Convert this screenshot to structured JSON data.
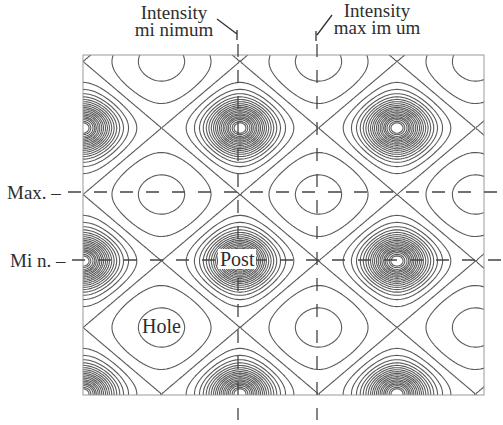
{
  "figure": {
    "annotations": {
      "intensity_minimum": {
        "line1": "Intensity",
        "line2": "mi nimum"
      },
      "intensity_maximum": {
        "line1": "Intensity",
        "line2": "max im um"
      },
      "max_row_label": "Max. –",
      "min_row_label": "Mi n. –",
      "post_label": "Post",
      "hole_label": "Hole"
    },
    "colors": {
      "line": "#5a5a5a",
      "frame": "#9a9a9a",
      "dash": "#444444",
      "text": "#2e2e2e"
    }
  },
  "chart_data": {
    "type": "contour",
    "title": "",
    "xlabel": "",
    "ylabel": "",
    "frame_px": {
      "left": 83,
      "top": 55,
      "right": 484,
      "bottom": 395
    },
    "lattice": {
      "maxima_px": [
        [
          83,
          128
        ],
        [
          238,
          128
        ],
        [
          396,
          128
        ],
        [
          83,
          261
        ],
        [
          240,
          261
        ],
        [
          396,
          261
        ],
        [
          83,
          396
        ],
        [
          238,
          396
        ],
        [
          396,
          396
        ]
      ],
      "minima_holes_px": [
        [
          161,
          60
        ],
        [
          318,
          60
        ],
        [
          474,
          60
        ],
        [
          161,
          193
        ],
        [
          318,
          193
        ],
        [
          474,
          193
        ],
        [
          161,
          325
        ],
        [
          318,
          325
        ],
        [
          474,
          325
        ]
      ],
      "period_px": {
        "x": 157,
        "y": 133
      }
    },
    "reference_lines": {
      "vertical_dashed_x_px": {
        "intensity_minimum": 238,
        "intensity_maximum": 317
      },
      "horizontal_dashed_y_px": {
        "max": 192,
        "min": 260
      }
    },
    "labels": [
      "Intensity minimum",
      "Intensity maximum",
      "Max.",
      "Min.",
      "Post",
      "Hole"
    ],
    "contour_levels": [
      -1.6,
      -0.6,
      0.0,
      0.45,
      0.75,
      0.95,
      1.1,
      1.22,
      1.32,
      1.41,
      1.49,
      1.56,
      1.62,
      1.68,
      1.73,
      1.78,
      1.82,
      1.86,
      1.89,
      1.92,
      1.95,
      1.97
    ]
  }
}
